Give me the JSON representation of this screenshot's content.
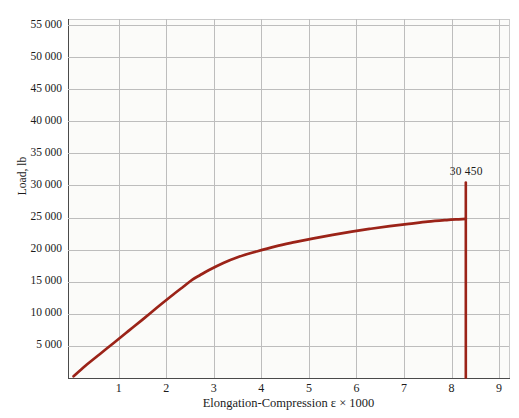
{
  "chart_data": {
    "type": "line",
    "title": "",
    "xlabel": "Elongation-Compression ε × 1000",
    "ylabel": "Load, lb",
    "xlim": [
      0,
      9.2
    ],
    "ylim": [
      0,
      56000
    ],
    "grid": true,
    "legend_position": "none",
    "x_ticks": [
      "1",
      "2",
      "3",
      "4",
      "5",
      "6",
      "7",
      "8",
      "9"
    ],
    "x_tick_values": [
      1,
      2,
      3,
      4,
      5,
      6,
      7,
      8,
      9
    ],
    "y_ticks": [
      "5 000",
      "10 000",
      "15 000",
      "20 000",
      "25 000",
      "30 000",
      "35 000",
      "40 000",
      "45 000",
      "50 000",
      "55 000"
    ],
    "y_tick_values": [
      5000,
      10000,
      15000,
      20000,
      25000,
      30000,
      35000,
      40000,
      45000,
      50000,
      55000
    ],
    "series": [
      {
        "name": "Load-elongation curve",
        "color": "#9b2318",
        "x": [
          0.05,
          0.3,
          0.6,
          0.9,
          1.2,
          1.5,
          1.8,
          2.1,
          2.35,
          2.55,
          2.7,
          2.9,
          3.2,
          3.5,
          3.9,
          4.3,
          4.7,
          5.1,
          5.5,
          5.9,
          6.3,
          6.7,
          7.1,
          7.5,
          7.9,
          8.15,
          8.3
        ],
        "y": [
          200,
          1850,
          3650,
          5450,
          7250,
          9050,
          10900,
          12700,
          14150,
          15300,
          15950,
          16800,
          17900,
          18800,
          19700,
          20500,
          21150,
          21750,
          22300,
          22800,
          23250,
          23650,
          24000,
          24350,
          24600,
          24720,
          24780
        ]
      },
      {
        "name": "Failure line",
        "color": "#9b2318",
        "x": [
          8.3,
          8.3
        ],
        "y": [
          30450,
          0
        ]
      }
    ],
    "annotations": [
      {
        "label": "30 450",
        "x": 8.3,
        "y": 30450
      }
    ]
  },
  "styling": {
    "curve_color": "#9b2318",
    "grid_color": "#bdbdbd",
    "axis_color": "#4a4a4a",
    "plot_background": "#fbfbf9",
    "page_background": "#ffffff",
    "text_color": "#1b1b1b"
  }
}
